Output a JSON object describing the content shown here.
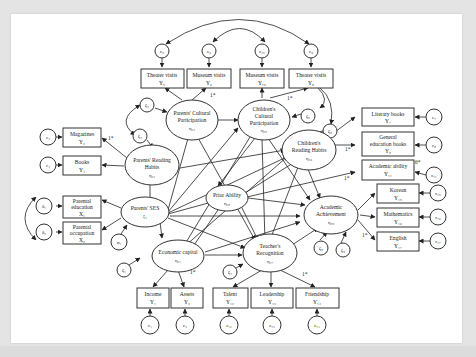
{
  "diagram": {
    "latent": {
      "parents_cultural": {
        "line1": "Parents' Cultural",
        "line2": "Participation",
        "sym": "η₁₃"
      },
      "childrens_cultural": {
        "line1": "Children's",
        "line2": "Cultural",
        "line3": "Participation",
        "sym": "η₁₅"
      },
      "parents_reading": {
        "line1": "Parents' Reading",
        "line2": "Habits",
        "sym": "η₁₂"
      },
      "childrens_reading": {
        "line1": "Children's",
        "line2": "Reading Habits",
        "sym": "η₁₆"
      },
      "parents_ses": {
        "line1": "Parents' SES",
        "sym": "ξ₁"
      },
      "prior_ability": {
        "line1": "Prior Ability",
        "sym": "η₁₈"
      },
      "academic": {
        "line1": "Academic",
        "line2": "Achievement",
        "sym": "η₁₉"
      },
      "teacher": {
        "line1": "Teacher's",
        "line2": "Recognition",
        "sym": "η₁₇"
      },
      "economic": {
        "line1": "Economic capital",
        "sym": "η₁₁"
      }
    },
    "observed": {
      "theater_p": {
        "line1": "Theater visits",
        "sym": "Y₅"
      },
      "museum_p": {
        "line1": "Museum visits",
        "sym": "Y₆"
      },
      "museum_c": {
        "line1": "Museum visits",
        "sym": "Y₁₀"
      },
      "theater_c": {
        "line1": "Theater visits",
        "sym": "Y₉"
      },
      "magazines": {
        "line1": "Magazines",
        "sym": "Y₃"
      },
      "books": {
        "line1": "Books",
        "sym": "Y₄"
      },
      "literary": {
        "line1": "Literary books",
        "sym": "Y₇"
      },
      "general": {
        "line1": "General",
        "line2": "education books",
        "sym": "Y₈"
      },
      "acad_ability": {
        "line1": "Academic ability",
        "sym": "Y₁₁"
      },
      "parent_edu": {
        "line1": "Parental",
        "line2": "education",
        "sym": "X₁"
      },
      "parent_occ": {
        "line1": "Parental",
        "line2": "occupation",
        "sym": "X₂"
      },
      "korean": {
        "line1": "Korean",
        "sym": "Y₁₅"
      },
      "math": {
        "line1": "Mathematics",
        "sym": "Y₁₆"
      },
      "english": {
        "line1": "English",
        "sym": "Y₁₇"
      },
      "income": {
        "line1": "Income",
        "sym": "Y₁"
      },
      "assets": {
        "line1": "Assets",
        "sym": "Y₂"
      },
      "talent": {
        "line1": "Talent",
        "sym": "Y₁₂"
      },
      "leadership": {
        "line1": "Leadership",
        "sym": "Y₁₃"
      },
      "friendship": {
        "line1": "Friendship",
        "sym": "Y₁₄"
      }
    },
    "errors": {
      "e5": "ε₅",
      "e6": "ε₆",
      "e10": "ε₁₀",
      "e9": "ε₉",
      "e3": "ε₃",
      "e4": "ε₄",
      "e7": "ε₇",
      "e8": "ε₈",
      "e11": "ε₁₁",
      "d1": "δ₁",
      "d2": "δ₂",
      "e15": "ε₁₅",
      "e16": "ε₁₆",
      "e17": "ε₁₇",
      "e1": "ε₁",
      "e2": "ε₂",
      "e12": "ε₁₂",
      "e13": "ε₁₃",
      "e14": "ε₁₄",
      "phi1": "φ₁"
    },
    "disturbances": {
      "z3": "ζ₃",
      "z2": "ζ₂",
      "z5": "ζ₅",
      "z6": "ζ₆",
      "z1": "ζ₁",
      "z7": "ζ₇",
      "z8": "ζ₈",
      "z9": "ζ₉"
    },
    "loadings": {
      "fixed": "1*",
      "theta": "θ*"
    }
  }
}
